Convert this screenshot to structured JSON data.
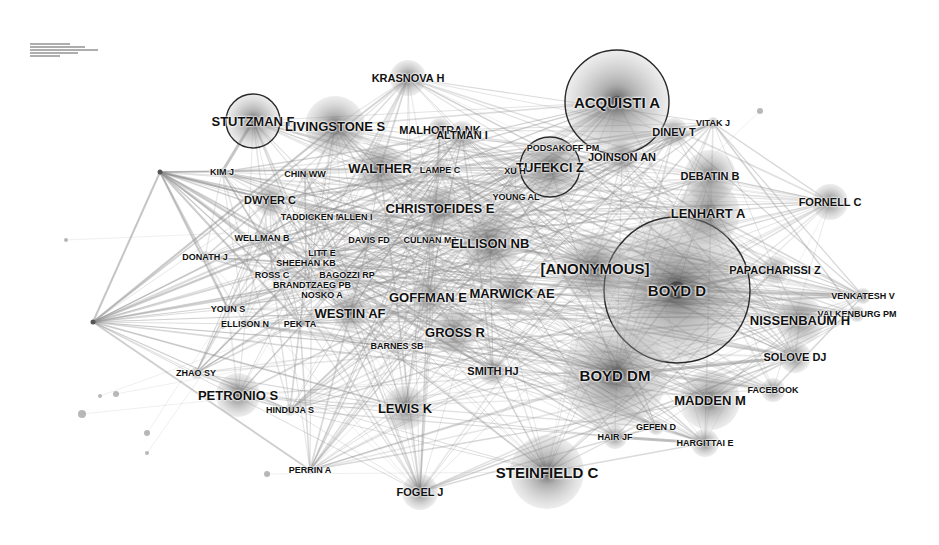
{
  "figure": {
    "type": "co-citation network",
    "width": 939,
    "height": 545,
    "background": "#ffffff",
    "edge_color": "#8c8c8c",
    "node_color": "#7a7a7a",
    "ring_color": "#2a2a2a",
    "legend_text": "illegible"
  },
  "nodes": [
    {
      "id": "acquisti-a",
      "label": "ACQUISTI A",
      "x": 617,
      "y": 102,
      "r": 52,
      "ring": true,
      "size": "xl"
    },
    {
      "id": "boyd-d",
      "label": "BOYD D",
      "x": 677,
      "y": 290,
      "r": 73,
      "ring": true,
      "size": "xl"
    },
    {
      "id": "tufekci-z",
      "label": "TUFEKCI Z",
      "x": 550,
      "y": 167,
      "r": 30,
      "ring": true,
      "size": "l"
    },
    {
      "id": "stutzman-f",
      "label": "STUTZMAN F",
      "x": 253,
      "y": 121,
      "r": 27,
      "ring": true,
      "size": "l"
    },
    {
      "id": "krasnova-h",
      "label": "KRASNOVA H",
      "x": 408,
      "y": 78,
      "r": 18,
      "ring": false,
      "size": "m"
    },
    {
      "id": "livingstone-s",
      "label": "LIVINGSTONE S",
      "x": 335,
      "y": 126,
      "r": 30,
      "ring": false,
      "size": "l"
    },
    {
      "id": "malhotra-nk",
      "label": "MALHOTRA NK",
      "x": 440,
      "y": 130,
      "r": 12,
      "ring": false,
      "size": "m"
    },
    {
      "id": "altman-i",
      "label": "ALTMAN I",
      "x": 462,
      "y": 135,
      "r": 14,
      "ring": false,
      "size": "m"
    },
    {
      "id": "dinev-t",
      "label": "DINEV T",
      "x": 674,
      "y": 132,
      "r": 14,
      "ring": false,
      "size": "m"
    },
    {
      "id": "vitak-j",
      "label": "VITAK J",
      "x": 713,
      "y": 123,
      "r": 6,
      "ring": false,
      "size": "s"
    },
    {
      "id": "podsakoff-pm",
      "label": "PODSAKOFF PM",
      "x": 563,
      "y": 148,
      "r": 8,
      "ring": false,
      "size": "s"
    },
    {
      "id": "joinson-an",
      "label": "JOINSON AN",
      "x": 622,
      "y": 157,
      "r": 16,
      "ring": false,
      "size": "m"
    },
    {
      "id": "xu-h",
      "label": "XU H",
      "x": 515,
      "y": 171,
      "r": 8,
      "ring": false,
      "size": "s"
    },
    {
      "id": "debatin-b",
      "label": "DEBATIN B",
      "x": 710,
      "y": 176,
      "r": 26,
      "ring": false,
      "size": "m"
    },
    {
      "id": "kim-j",
      "label": "KIM J",
      "x": 222,
      "y": 172,
      "r": 4,
      "ring": false,
      "size": "s"
    },
    {
      "id": "chin-ww",
      "label": "CHIN WW",
      "x": 305,
      "y": 174,
      "r": 6,
      "ring": false,
      "size": "s"
    },
    {
      "id": "walther",
      "label": "WALTHER",
      "x": 380,
      "y": 168,
      "r": 24,
      "ring": false,
      "size": "l"
    },
    {
      "id": "lampe-c",
      "label": "LAMPE C",
      "x": 440,
      "y": 170,
      "r": 10,
      "ring": false,
      "size": "s"
    },
    {
      "id": "young-al",
      "label": "YOUNG AL",
      "x": 516,
      "y": 197,
      "r": 8,
      "ring": false,
      "size": "s"
    },
    {
      "id": "fornell-c",
      "label": "FORNELL C",
      "x": 830,
      "y": 202,
      "r": 18,
      "ring": false,
      "size": "m"
    },
    {
      "id": "dwyer-c",
      "label": "DWYER C",
      "x": 270,
      "y": 200,
      "r": 16,
      "ring": false,
      "size": "m"
    },
    {
      "id": "christofides-e",
      "label": "CHRISTOFIDES E",
      "x": 440,
      "y": 208,
      "r": 20,
      "ring": false,
      "size": "l"
    },
    {
      "id": "lenhart-a",
      "label": "LENHART A",
      "x": 708,
      "y": 213,
      "r": 32,
      "ring": false,
      "size": "l"
    },
    {
      "id": "taddicken-m",
      "label": "TADDICKEN M",
      "x": 312,
      "y": 217,
      "r": 8,
      "ring": false,
      "size": "s"
    },
    {
      "id": "allen-i",
      "label": "ALLEN I",
      "x": 355,
      "y": 217,
      "r": 8,
      "ring": false,
      "size": "s"
    },
    {
      "id": "wellman-b",
      "label": "WELLMAN B",
      "x": 262,
      "y": 238,
      "r": 8,
      "ring": false,
      "size": "s"
    },
    {
      "id": "davis-fd",
      "label": "DAVIS FD",
      "x": 369,
      "y": 240,
      "r": 8,
      "ring": false,
      "size": "s"
    },
    {
      "id": "culnan-mj",
      "label": "CULNAN MJ",
      "x": 430,
      "y": 240,
      "r": 10,
      "ring": false,
      "size": "s"
    },
    {
      "id": "ellison-nb",
      "label": "ELLISON NB",
      "x": 490,
      "y": 243,
      "r": 30,
      "ring": false,
      "size": "l"
    },
    {
      "id": "donath-j",
      "label": "DONATH J",
      "x": 205,
      "y": 257,
      "r": 6,
      "ring": false,
      "size": "s"
    },
    {
      "id": "litt-e",
      "label": "LITT E",
      "x": 322,
      "y": 253,
      "r": 6,
      "ring": false,
      "size": "s"
    },
    {
      "id": "sheehan-kb",
      "label": "SHEEHAN KB",
      "x": 306,
      "y": 263,
      "r": 6,
      "ring": false,
      "size": "s"
    },
    {
      "id": "anonymous",
      "label": "[ANONYMOUS]",
      "x": 595,
      "y": 268,
      "r": 34,
      "ring": false,
      "size": "xl"
    },
    {
      "id": "papacharissi-z",
      "label": "PAPACHARISSI Z",
      "x": 775,
      "y": 270,
      "r": 14,
      "ring": false,
      "size": "m"
    },
    {
      "id": "ross-c",
      "label": "ROSS C",
      "x": 272,
      "y": 275,
      "r": 6,
      "ring": false,
      "size": "s"
    },
    {
      "id": "bagozzi-rp",
      "label": "BAGOZZI RP",
      "x": 347,
      "y": 275,
      "r": 6,
      "ring": false,
      "size": "s"
    },
    {
      "id": "brandtzaeg-pb",
      "label": "BRANDTZAEG PB",
      "x": 312,
      "y": 285,
      "r": 6,
      "ring": false,
      "size": "s"
    },
    {
      "id": "nosko-a",
      "label": "NOSKO A",
      "x": 322,
      "y": 295,
      "r": 6,
      "ring": false,
      "size": "s"
    },
    {
      "id": "goffman-e",
      "label": "GOFFMAN E",
      "x": 428,
      "y": 297,
      "r": 18,
      "ring": false,
      "size": "l"
    },
    {
      "id": "marwick-ae",
      "label": "MARWICK AE",
      "x": 512,
      "y": 293,
      "r": 20,
      "ring": false,
      "size": "l"
    },
    {
      "id": "venkatesh-v",
      "label": "VENKATESH V",
      "x": 863,
      "y": 296,
      "r": 8,
      "ring": false,
      "size": "s"
    },
    {
      "id": "youn-s",
      "label": "YOUN S",
      "x": 228,
      "y": 309,
      "r": 5,
      "ring": false,
      "size": "s"
    },
    {
      "id": "westin-af",
      "label": "WESTIN AF",
      "x": 350,
      "y": 313,
      "r": 18,
      "ring": false,
      "size": "l"
    },
    {
      "id": "valkenburg-pm",
      "label": "VALKENBURG PM",
      "x": 857,
      "y": 314,
      "r": 8,
      "ring": false,
      "size": "s"
    },
    {
      "id": "nissenbaum-h",
      "label": "NISSENBAUM H",
      "x": 800,
      "y": 320,
      "r": 24,
      "ring": false,
      "size": "l"
    },
    {
      "id": "ellison-n",
      "label": "ELLISON N",
      "x": 245,
      "y": 324,
      "r": 5,
      "ring": false,
      "size": "s"
    },
    {
      "id": "pek-ta",
      "label": "PEK TA",
      "x": 300,
      "y": 324,
      "r": 5,
      "ring": false,
      "size": "s"
    },
    {
      "id": "gross-r",
      "label": "GROSS R",
      "x": 455,
      "y": 332,
      "r": 22,
      "ring": false,
      "size": "l"
    },
    {
      "id": "barnes-sb",
      "label": "BARNES SB",
      "x": 397,
      "y": 346,
      "r": 8,
      "ring": false,
      "size": "s"
    },
    {
      "id": "solove-dj",
      "label": "SOLOVE DJ",
      "x": 795,
      "y": 357,
      "r": 16,
      "ring": false,
      "size": "m"
    },
    {
      "id": "smith-hj",
      "label": "SMITH HJ",
      "x": 493,
      "y": 371,
      "r": 14,
      "ring": false,
      "size": "m"
    },
    {
      "id": "zhao-sy",
      "label": "ZHAO SY",
      "x": 196,
      "y": 373,
      "r": 6,
      "ring": false,
      "size": "s"
    },
    {
      "id": "boyd-dm",
      "label": "BOYD DM",
      "x": 615,
      "y": 375,
      "r": 52,
      "ring": false,
      "size": "xl"
    },
    {
      "id": "facebook",
      "label": "FACEBOOK",
      "x": 773,
      "y": 390,
      "r": 12,
      "ring": false,
      "size": "s"
    },
    {
      "id": "petronio-s",
      "label": "PETRONIO S",
      "x": 238,
      "y": 395,
      "r": 22,
      "ring": false,
      "size": "l"
    },
    {
      "id": "madden-m",
      "label": "MADDEN M",
      "x": 710,
      "y": 400,
      "r": 30,
      "ring": false,
      "size": "l"
    },
    {
      "id": "lewis-k",
      "label": "LEWIS K",
      "x": 405,
      "y": 408,
      "r": 22,
      "ring": false,
      "size": "l"
    },
    {
      "id": "hinduja-s",
      "label": "HINDUJA S",
      "x": 290,
      "y": 410,
      "r": 6,
      "ring": false,
      "size": "s"
    },
    {
      "id": "gefen-d",
      "label": "GEFEN D",
      "x": 656,
      "y": 427,
      "r": 8,
      "ring": false,
      "size": "s"
    },
    {
      "id": "hair-jf",
      "label": "HAIR JF",
      "x": 615,
      "y": 437,
      "r": 12,
      "ring": false,
      "size": "s"
    },
    {
      "id": "hargittai-e",
      "label": "HARGITTAI E",
      "x": 705,
      "y": 443,
      "r": 14,
      "ring": false,
      "size": "s"
    },
    {
      "id": "perrin-a",
      "label": "PERRIN A",
      "x": 310,
      "y": 470,
      "r": 4,
      "ring": false,
      "size": "s"
    },
    {
      "id": "steinfield-c",
      "label": "STEINFIELD C",
      "x": 547,
      "y": 472,
      "r": 37,
      "ring": false,
      "size": "xl"
    },
    {
      "id": "fogel-j",
      "label": "FOGEL J",
      "x": 420,
      "y": 492,
      "r": 18,
      "ring": false,
      "size": "m"
    }
  ],
  "hubs": [
    {
      "id": "hub-left",
      "x": 93,
      "y": 322
    },
    {
      "id": "hub-top-left",
      "x": 160,
      "y": 172
    }
  ],
  "minor_nodes": [
    {
      "x": 82,
      "y": 414,
      "r": 4
    },
    {
      "x": 116,
      "y": 394,
      "r": 3
    },
    {
      "x": 147,
      "y": 453,
      "r": 2
    },
    {
      "x": 147,
      "y": 433,
      "r": 3
    },
    {
      "x": 267,
      "y": 474,
      "r": 3
    },
    {
      "x": 760,
      "y": 111,
      "r": 3
    },
    {
      "x": 223,
      "y": 327,
      "r": 2
    },
    {
      "x": 66,
      "y": 240,
      "r": 2
    },
    {
      "x": 100,
      "y": 396,
      "r": 2
    }
  ]
}
